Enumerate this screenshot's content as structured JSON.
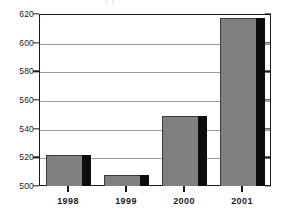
{
  "chart_data": {
    "type": "bar",
    "title": "",
    "title_fragment": "(                                    )",
    "xlabel": "",
    "ylabel": "",
    "categories": [
      "1998",
      "1999",
      "2000",
      "2001"
    ],
    "values": [
      522,
      508,
      549,
      617
    ],
    "series": [
      {
        "name": "",
        "values": [
          522,
          508,
          549,
          617
        ]
      }
    ],
    "ylim": [
      500,
      620
    ],
    "yticks": [
      500,
      520,
      540,
      560,
      580,
      600,
      620
    ],
    "ytick_labels": [
      "500",
      "520",
      "540",
      "560",
      "580",
      "600",
      "620"
    ],
    "grid": true,
    "grid_axis": "y",
    "legend": false,
    "legend_position": "none",
    "bar_color": "#808080",
    "bar_side_color": "#0d0d0d",
    "bar_edge_color": "#3a3a3a",
    "gridline_color": "#9a9a9a",
    "frame_color": "#1a1a1a",
    "background_color": "#ffffff",
    "text_color": "#1d1d1d",
    "style": "3d-shaded-bars"
  }
}
